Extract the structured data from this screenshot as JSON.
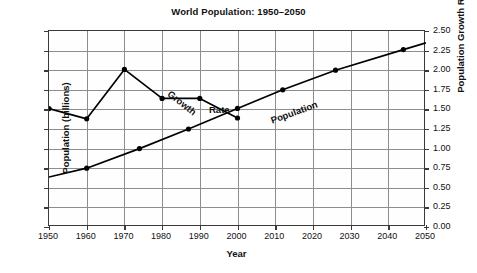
{
  "chart_data": {
    "type": "line",
    "title": "World Population: 1950–2050",
    "xlabel": "Year",
    "ylabel": "Population (billions)",
    "ylabel_right": "Population Growth Rate (%)",
    "xlim": [
      1950,
      2050
    ],
    "ylim": [
      0,
      10
    ],
    "ylim_right": [
      0.0,
      2.5
    ],
    "grid": true,
    "legend": "inline-annotations",
    "xticks": [
      1950,
      1960,
      1970,
      1980,
      1990,
      2000,
      2010,
      2020,
      2030,
      2040,
      2050
    ],
    "xticklabels": [
      "1950",
      "1960",
      "1970",
      "1980",
      "1990",
      "2000",
      "2010",
      "2020",
      "2030",
      "2040",
      "2050"
    ],
    "yticks_left": [
      0,
      1,
      2,
      3,
      4,
      5,
      6,
      7,
      8,
      9,
      10
    ],
    "yticklabels_left": [
      "0",
      "1",
      "2",
      "3",
      "4",
      "5",
      "6",
      "7",
      "8",
      "9",
      "10"
    ],
    "yticks_right": [
      0.0,
      0.25,
      0.5,
      0.75,
      1.0,
      1.25,
      1.5,
      1.75,
      2.0,
      2.25,
      2.5
    ],
    "yticklabels_right": [
      "0.00",
      "0.25",
      "0.50",
      "0.75",
      "1.00",
      "1.25",
      "1.50",
      "1.75",
      "2.00",
      "2.25",
      "2.50"
    ],
    "series": [
      {
        "name": "Population",
        "axis": "left",
        "units": "billions",
        "annotation": "Population",
        "marker": "filled-circle",
        "x": [
          1950,
          1960,
          1974,
          1987,
          2000,
          2012,
          2026,
          2044,
          2050
        ],
        "y": [
          2.55,
          3.0,
          4.0,
          5.0,
          6.05,
          7.0,
          8.0,
          9.05,
          9.4
        ],
        "markers_x": [
          1960,
          1974,
          1987,
          2000,
          2012,
          2026,
          2044
        ],
        "markers_y": [
          3.0,
          4.0,
          5.0,
          6.05,
          7.0,
          8.0,
          9.05
        ]
      },
      {
        "name": "Growth Rate",
        "axis": "right",
        "units": "%",
        "annotation": "Growth Rate",
        "marker": "filled-circle",
        "x": [
          1950,
          1960,
          1970,
          1980,
          1990,
          2000
        ],
        "y": [
          1.51,
          1.38,
          2.01,
          1.64,
          1.64,
          1.39
        ],
        "y_in_left_scale": [
          6.03,
          5.52,
          8.04,
          6.55,
          6.55,
          5.56
        ]
      }
    ]
  }
}
